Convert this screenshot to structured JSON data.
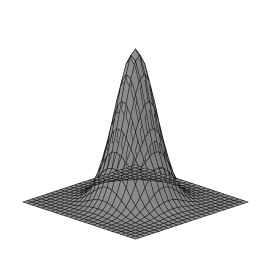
{
  "figure": {
    "title": "",
    "background_color": "#ffffff",
    "width": 267,
    "height": 256,
    "alt_text": "Three-dimensional wireframe mesh surface plot of a two-dimensional Gaussian bell curve rendered in grayscale on a white background"
  },
  "chart_data": {
    "type": "surface",
    "title": "",
    "subtitle": "",
    "xlabel": "",
    "ylabel": "",
    "zlabel": "",
    "legend": [],
    "annotations": [],
    "grid": true,
    "axes_visible": false,
    "tick_labels_visible": false,
    "function": "z = exp(-(x^2 + y^2) / (2 * sigma^2))",
    "surface": {
      "amplitude": 1.0,
      "sigma": 0.26,
      "x_range": [
        -1.0,
        1.0
      ],
      "y_range": [
        -1.0,
        1.0
      ],
      "z_range": [
        0.0,
        1.0
      ],
      "grid_nx": 25,
      "grid_ny": 25,
      "peak_x": 0.0,
      "peak_y": 0.0,
      "peak_z": 1.0
    },
    "projection": {
      "kind": "isometric-oblique",
      "elevation_deg": 30,
      "azimuth_deg": 45,
      "x_axis_screen": [
        4.7,
        -1.55
      ],
      "y_axis_screen": [
        4.7,
        1.55
      ],
      "z_axis_screen": [
        0,
        -153
      ],
      "origin_screen_x": 135.5,
      "origin_screen_y": 202.0
    },
    "style": {
      "face_color_low": "#8e8e8e",
      "face_color_high": "#9b9b9b",
      "face_color_shadow": "#6f6f6f",
      "edge_color": "#1a1a1a",
      "edge_width": 0.55,
      "shading": "flat-lambert"
    },
    "silhouette_landmarks": {
      "apex_screen": [
        137,
        12
      ],
      "left_corner_screen": [
        18,
        165
      ],
      "front_corner_screen": [
        135,
        240
      ],
      "right_corner_screen": [
        253,
        163
      ],
      "back_corner_screen": [
        137,
        88
      ]
    },
    "z_profile_along_center_row": [
      0.0,
      0.0,
      0.0,
      0.0,
      0.001,
      0.004,
      0.016,
      0.052,
      0.138,
      0.302,
      0.552,
      0.841,
      1.0,
      0.841,
      0.552,
      0.302,
      0.138,
      0.052,
      0.016,
      0.004,
      0.001,
      0.0,
      0.0,
      0.0,
      0.0
    ],
    "x_tick_values": [
      -1.0,
      -0.5,
      0.0,
      0.5,
      1.0
    ],
    "y_tick_values": [
      -1.0,
      -0.5,
      0.0,
      0.5,
      1.0
    ],
    "z_tick_values": [
      0.0,
      0.25,
      0.5,
      0.75,
      1.0
    ]
  }
}
